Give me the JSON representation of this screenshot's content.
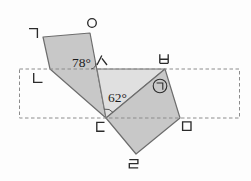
{
  "figure": {
    "type": "geometry-diagram",
    "background_color": "#fdfdfd",
    "shade_dark": "#c8c8c8",
    "shade_light": "#e0e0e0",
    "outline_color": "#6d6d6d",
    "dash_color": "#8c8c8c"
  },
  "rectangle": {
    "style": "dashed",
    "path": "M19.5,69 H239.5 V118 H19.5 Z"
  },
  "shapes": {
    "quad_left": {
      "vertices": "ㄱ ㅇ ㄷ ㄴ",
      "points": "43,37 90,33 106,118 50,69"
    },
    "triangle_mid": {
      "vertices": "ㅅ ㅂ ㄷ",
      "points": "97,69 165,69 106,118"
    },
    "quad_right": {
      "vertices": "ㄷ ㅂ ㅁ ㄹ",
      "points": "106,118 165,69 180,118 136,154"
    }
  },
  "angles": {
    "at_siot": {
      "text": "78°",
      "value": 78,
      "vertex": "ㅅ"
    },
    "at_digeut": {
      "text": "62°",
      "value": 62,
      "vertex": "ㄷ"
    },
    "marked_unknown": {
      "char": "㉠",
      "near_vertex": "ㅂ"
    }
  },
  "arcs": {
    "arc_78": "M91,69 A6,6 0 0 0 95.9,63.1",
    "arc_62": "M104.4,109.2 A9,9 0 0 1 112.9,112.3"
  },
  "vertex_labels": {
    "giyeok": {
      "char": "ㄱ",
      "path": "M29,28.6 H37.4 V38"
    },
    "nieun": {
      "char": "ㄴ",
      "path": "M33.7,73 V82.4 H42.5"
    },
    "digeut": {
      "char": "ㄷ",
      "path": "M104.5,122.4 H96.8 V131.2 H104.5"
    },
    "rieul": {
      "char": "ㄹ",
      "path": "M129.3,159.6 H137.9 V163.6 H129.3 V167.8 H138.2"
    },
    "mieum": {
      "char": "ㅁ",
      "path": "M182.6,121.8 H191 V130.4 H182.6 Z"
    },
    "bieup": {
      "char": "ㅂ",
      "path": "M159.8,54.3 V63.3 M168.2,54.3 V63.3 M159.8,59.2 H168.2 M159.8,63.3 H168.2"
    },
    "siot": {
      "char": "ㅅ",
      "path": "M101.8,55.5 L97,65 M101.9,58.3 L107,65"
    },
    "ieung": {
      "char": "ㅇ",
      "path": "M96.3,23 A4.3,4.3 0 1 1 87.7,23 A4.3,4.3 0 1 1 96.3,23 Z"
    },
    "circled_giyeok": {
      "char": "㉠",
      "circle_path": "M166.8,86 A6.8,6.8 0 1 1 153.2,86 A6.8,6.8 0 1 1 166.8,86 Z",
      "inner_path": "M156.6,83 H162.8 V89.8"
    }
  }
}
